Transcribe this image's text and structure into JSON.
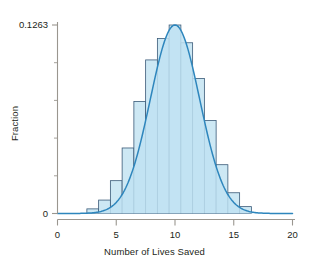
{
  "chart_data": {
    "type": "bar",
    "title": "",
    "subtitle": "",
    "xlabel": "Number of Lives Saved",
    "ylabel": "Fraction",
    "xlim": [
      0,
      20
    ],
    "ylim": [
      0,
      0.1263
    ],
    "grid": false,
    "legend": null,
    "x_ticks": [
      0,
      5,
      10,
      15,
      20
    ],
    "x_tick_labels": [
      "0",
      "5",
      "10",
      "15",
      "20"
    ],
    "y_ticks": [
      0,
      0.1263
    ],
    "y_tick_labels": [
      "0",
      "0.1263"
    ],
    "y_minor_ticks": [
      0.02526,
      0.05052,
      0.07578,
      0.10104
    ],
    "bin_width": 1,
    "bin_centers": [
      3,
      4,
      5,
      6,
      7,
      8,
      9,
      10,
      11,
      12,
      13,
      14,
      15,
      16
    ],
    "categories": [
      "3",
      "4",
      "5",
      "6",
      "7",
      "8",
      "9",
      "10",
      "11",
      "12",
      "13",
      "14",
      "15",
      "16"
    ],
    "values": [
      0.0031,
      0.009,
      0.022,
      0.0439,
      0.0751,
      0.1029,
      0.1172,
      0.1263,
      0.1144,
      0.0905,
      0.0623,
      0.0327,
      0.0139,
      0.0046
    ],
    "series": [
      {
        "name": "histogram",
        "type": "bar",
        "values": [
          0.0031,
          0.009,
          0.022,
          0.0439,
          0.0751,
          0.1029,
          0.1172,
          0.1263,
          0.1144,
          0.0905,
          0.0623,
          0.0327,
          0.0139,
          0.0046
        ]
      },
      {
        "name": "normal-density-curve",
        "type": "line",
        "mean": 10.0,
        "sigma": 2.1,
        "peak": 0.1263,
        "x": [
          0,
          1,
          2,
          3,
          4,
          5,
          6,
          7,
          8,
          9,
          10,
          11,
          12,
          13,
          14,
          15,
          16,
          17,
          18,
          19,
          20
        ],
        "values": [
          0.0,
          0.0001,
          0.0003,
          0.0014,
          0.006,
          0.0193,
          0.0475,
          0.0899,
          0.1306,
          0.1455,
          0.1263,
          0.0899,
          0.0475,
          0.0193,
          0.006,
          0.0014,
          0.0003,
          0.0001,
          0.0,
          0.0,
          0.0
        ]
      }
    ],
    "colors": {
      "bar_fill": "#cde8f4",
      "bar_edge": "#3a5a78",
      "curve": "#2e86bd",
      "curve_fill": "#bfe2f2",
      "axis": "#9a968f",
      "text": "#231f20"
    }
  }
}
